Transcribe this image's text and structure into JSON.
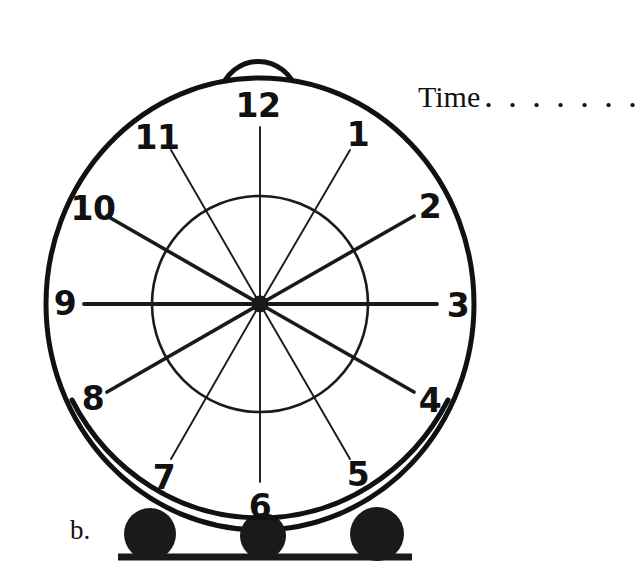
{
  "page": {
    "item_label": "b.",
    "background_color": "#ffffff",
    "ink_color": "#111111"
  },
  "prompt": {
    "label": "Time",
    "dots": ". . . . . . ."
  },
  "clock": {
    "name": "alarm-clock-face",
    "hour_numbers": [
      "12",
      "1",
      "2",
      "3",
      "4",
      "5",
      "6",
      "7",
      "8",
      "9",
      "10",
      "11"
    ],
    "numbers": [
      {
        "value": "12",
        "hour": 12,
        "x": 258,
        "y": 105
      },
      {
        "value": "1",
        "hour": 1,
        "x": 358,
        "y": 134
      },
      {
        "value": "2",
        "hour": 2,
        "x": 430,
        "y": 206
      },
      {
        "value": "3",
        "hour": 3,
        "x": 458,
        "y": 305
      },
      {
        "value": "4",
        "hour": 4,
        "x": 430,
        "y": 400
      },
      {
        "value": "5",
        "hour": 5,
        "x": 358,
        "y": 474
      },
      {
        "value": "6",
        "hour": 6,
        "x": 260,
        "y": 506
      },
      {
        "value": "7",
        "hour": 7,
        "x": 164,
        "y": 477
      },
      {
        "value": "8",
        "hour": 8,
        "x": 93,
        "y": 398
      },
      {
        "value": "9",
        "hour": 9,
        "x": 65,
        "y": 303
      },
      {
        "value": "10",
        "hour": 10,
        "x": 93,
        "y": 208
      },
      {
        "value": "11",
        "hour": 11,
        "x": 157,
        "y": 137
      }
    ],
    "geometry": {
      "center_x": 260,
      "center_y": 304,
      "outer_rx": 214,
      "outer_ry": 226,
      "inner_r": 108,
      "hub_r": 8,
      "bell_cx": 258,
      "bell_cy": 82,
      "bell_r": 40
    },
    "feet": [
      {
        "name": "foot-left",
        "cx": 150,
        "cy": 534,
        "r": 26
      },
      {
        "name": "foot-center",
        "cx": 263,
        "cy": 536,
        "r": 23
      },
      {
        "name": "foot-right",
        "cx": 377,
        "cy": 534,
        "r": 27
      }
    ],
    "ground_line": {
      "x1": 118,
      "x2": 412,
      "y": 557
    },
    "spokes": [
      {
        "hour": 12,
        "weight": "thin"
      },
      {
        "hour": 1,
        "weight": "thin"
      },
      {
        "hour": 2,
        "weight": "thick"
      },
      {
        "hour": 3,
        "weight": "thick"
      },
      {
        "hour": 4,
        "weight": "thick"
      },
      {
        "hour": 5,
        "weight": "thin"
      },
      {
        "hour": 6,
        "weight": "thin"
      },
      {
        "hour": 7,
        "weight": "thin"
      },
      {
        "hour": 8,
        "weight": "thick"
      },
      {
        "hour": 9,
        "weight": "thick"
      },
      {
        "hour": 10,
        "weight": "thick"
      },
      {
        "hour": 11,
        "weight": "thin"
      }
    ]
  }
}
